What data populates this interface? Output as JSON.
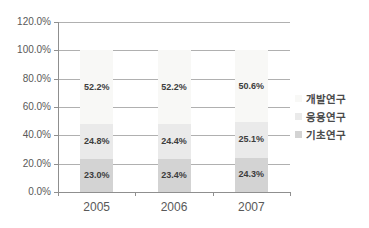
{
  "chart_data": {
    "type": "bar",
    "stacked": true,
    "title": "",
    "categories": [
      "2005",
      "2006",
      "2007"
    ],
    "series": [
      {
        "name": "기초연구",
        "color": "#d3d3d3",
        "values": [
          23.0,
          23.4,
          24.3
        ],
        "labels": [
          "23.0%",
          "23.4%",
          "24.3%"
        ]
      },
      {
        "name": "응용연구",
        "color": "#eaeaea",
        "values": [
          24.8,
          24.4,
          25.1
        ],
        "labels": [
          "24.8%",
          "24.4%",
          "25.1%"
        ]
      },
      {
        "name": "개발연구",
        "color": "#f8f8f6",
        "values": [
          52.2,
          52.2,
          50.6
        ],
        "labels": [
          "52.2%",
          "52.2%",
          "50.6%"
        ]
      }
    ],
    "y_axis": {
      "min": 0,
      "max": 120,
      "ticks": [
        "0.0%",
        "20.0%",
        "40.0%",
        "60.0%",
        "80.0%",
        "100.0%",
        "120.0%"
      ]
    },
    "legend": {
      "position": "right",
      "items": [
        "개발연구",
        "응용연구",
        "기초연구"
      ]
    },
    "grid": true,
    "colors": {
      "gridline": "#b0b0b0",
      "axis": "#8f8f8f",
      "axis_text": "#595959",
      "data_label_text": "#3d3d3d",
      "legend_text": "#4a4a4a",
      "background": "#ffffff"
    }
  }
}
